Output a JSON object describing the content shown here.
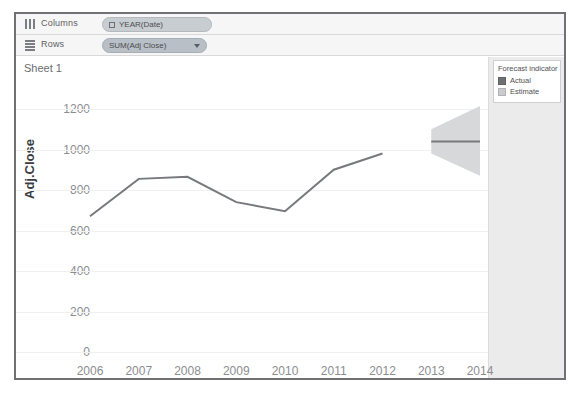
{
  "window": {
    "shelves": [
      {
        "name": "columns",
        "label": "Columns",
        "icon": "columns-icon",
        "pill": {
          "text": "YEAR(Date)",
          "glyph": "calendar-glyph",
          "has_caret": false
        }
      },
      {
        "name": "rows",
        "label": "Rows",
        "icon": "rows-icon",
        "pill": {
          "text": "SUM(Adj Close)",
          "glyph": "",
          "has_caret": true
        }
      }
    ],
    "sheet_title": "Sheet 1"
  },
  "legend": {
    "title": "Forecast indicator",
    "items": [
      {
        "label": "Actual",
        "color": "#6e7072"
      },
      {
        "label": "Estimate",
        "color": "#c9cbcd"
      }
    ]
  },
  "colors": {
    "line": "#77797c",
    "forecast_band": "#d6d8da",
    "grid": "#f0f0f0",
    "panel": "#ebebeb",
    "tick_text": "#8b8d90"
  },
  "chart_data": {
    "type": "line",
    "title": "Sheet 1",
    "xlabel": "Year of Date",
    "ylabel": "Adj.Close",
    "x": [
      2006,
      2007,
      2008,
      2009,
      2010,
      2011,
      2012,
      2013,
      2014
    ],
    "categories": [
      "2006",
      "2007",
      "2008",
      "2009",
      "2010",
      "2011",
      "2012",
      "2013",
      "2014"
    ],
    "ylim": [
      0,
      1200
    ],
    "yticks": [
      0,
      200,
      400,
      600,
      800,
      1000,
      1200
    ],
    "grid": true,
    "legend_position": "right",
    "series": [
      {
        "name": "Actual",
        "x": [
          2006,
          2007,
          2008,
          2009,
          2010,
          2011,
          2012
        ],
        "values": [
          670,
          855,
          865,
          740,
          695,
          900,
          980
        ]
      },
      {
        "name": "Estimate",
        "x": [
          2013,
          2014
        ],
        "values": [
          1040,
          1040
        ],
        "band_lower": [
          980,
          870
        ],
        "band_upper": [
          1100,
          1215
        ]
      }
    ]
  }
}
